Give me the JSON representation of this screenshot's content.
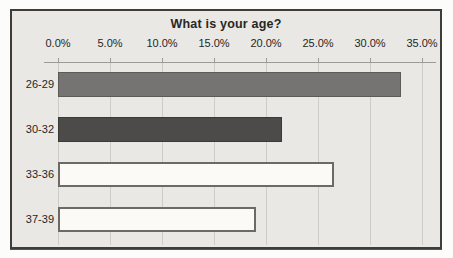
{
  "chart_data": {
    "type": "bar",
    "orientation": "horizontal",
    "title": "What is your age?",
    "categories": [
      "26-29",
      "30-32",
      "33-36",
      "37-39"
    ],
    "values": [
      33.0,
      21.5,
      26.5,
      19.0
    ],
    "value_unit": "%",
    "x_ticks": [
      "0.0%",
      "5.0%",
      "10.0%",
      "15.0%",
      "20.0%",
      "25.0%",
      "30.0%",
      "35.0%"
    ],
    "x_tick_values": [
      0,
      5,
      10,
      15,
      20,
      25,
      30,
      35
    ],
    "xlim": [
      0,
      35
    ],
    "xlabel": "",
    "ylabel": "",
    "axis_position": "top",
    "grid": "vertical",
    "legend": "none",
    "bar_styles": [
      {
        "fill": "#767472",
        "border": "#5c5b58",
        "border_width": 1
      },
      {
        "fill": "#4c4b49",
        "border": "#3a3937",
        "border_width": 1
      },
      {
        "fill": "#fbfaf7",
        "border": "#6b6a66",
        "border_width": 2
      },
      {
        "fill": "#fbfaf7",
        "border": "#6b6a66",
        "border_width": 2
      }
    ],
    "colors": {
      "plot_background": "#e9e8e4",
      "frame_border": "#3e3d3a",
      "gridline": "#cdccc7",
      "axis_line": "#9b9a95",
      "text": "#262624",
      "page_background": "#fcfcfa"
    }
  }
}
